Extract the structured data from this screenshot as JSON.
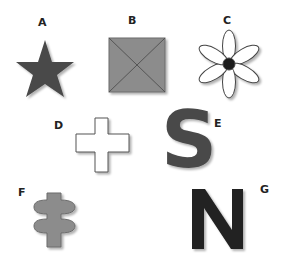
{
  "figure": {
    "items": [
      {
        "label": "A",
        "shape": "star-icon",
        "fill": "#4a4a4a"
      },
      {
        "label": "B",
        "shape": "square-with-diagonals-icon",
        "fill": "#8c8c8c"
      },
      {
        "label": "C",
        "shape": "flower-icon",
        "fill": "#ffffff",
        "center_fill": "#1e1e1e"
      },
      {
        "label": "D",
        "shape": "cross-icon",
        "fill": "#ffffff"
      },
      {
        "label": "E",
        "shape": "letter-s-icon",
        "glyph": "S",
        "fill": "#4a4a4a"
      },
      {
        "label": "F",
        "shape": "double-disc-pillar-icon",
        "fill": "#8c8c8c"
      },
      {
        "label": "G",
        "shape": "letter-n-icon",
        "glyph": "N",
        "fill": "#222222"
      }
    ]
  }
}
